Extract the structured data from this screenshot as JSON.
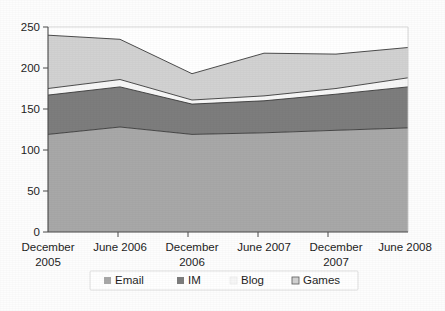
{
  "chart_data": {
    "type": "area",
    "stacked": true,
    "title": "",
    "subtitle": "",
    "xlabel": "",
    "ylabel": "",
    "categories": [
      "December 2005",
      "June 2006",
      "December 2006",
      "June 2007",
      "December 2007",
      "June 2008"
    ],
    "ytick_labels": [
      "0",
      "50",
      "100",
      "150",
      "200",
      "250"
    ],
    "ytick_values": [
      0,
      50,
      100,
      150,
      200,
      250
    ],
    "ylim": [
      0,
      250
    ],
    "grid": false,
    "legend_position": "bottom",
    "series": [
      {
        "name": "Email",
        "color": "#a8a8a8",
        "values": [
          119,
          128,
          119,
          121,
          124,
          127
        ]
      },
      {
        "name": "IM",
        "color": "#7d7d7d",
        "values": [
          48,
          49,
          37,
          39,
          44,
          50
        ]
      },
      {
        "name": "Blog",
        "color": "#f7f7f7",
        "values": [
          8,
          9,
          5,
          6,
          7,
          11
        ]
      },
      {
        "name": "Games",
        "color": "#d2d2d2",
        "values": [
          65,
          49,
          32,
          52,
          42,
          37
        ]
      }
    ],
    "cumulative_totals": [
      240,
      235,
      193,
      218,
      217,
      225
    ],
    "legend_entries": [
      {
        "label": "Email",
        "color": "#a8a8a8"
      },
      {
        "label": "IM",
        "color": "#7d7d7d"
      },
      {
        "label": "Blog",
        "color": "#f7f7f7"
      },
      {
        "label": "Games",
        "color": "#d2d2d2"
      }
    ]
  },
  "axis": {
    "ytick_0": "0",
    "ytick_1": "50",
    "ytick_2": "100",
    "ytick_3": "150",
    "ytick_4": "200",
    "ytick_5": "250",
    "xtick_0_line1": "December",
    "xtick_0_line2": "2005",
    "xtick_1_line1": "June 2006",
    "xtick_1_line2": "",
    "xtick_2_line1": "December",
    "xtick_2_line2": "2006",
    "xtick_3_line1": "June 2007",
    "xtick_3_line2": "",
    "xtick_4_line1": "December",
    "xtick_4_line2": "2007",
    "xtick_5_line1": "June 2008",
    "xtick_5_line2": ""
  },
  "legend": {
    "item_0": "Email",
    "item_1": "IM",
    "item_2": "Blog",
    "item_3": "Games"
  }
}
